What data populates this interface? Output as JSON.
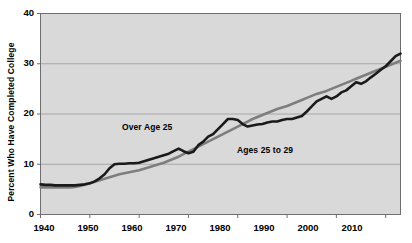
{
  "chart_data": {
    "type": "line",
    "title": "",
    "xlabel": "",
    "ylabel": "Percent  Who Have Completed College",
    "xlim": [
      1940,
      2013
    ],
    "ylim": [
      0,
      40
    ],
    "xticks": [
      1940,
      1950,
      1960,
      1970,
      1980,
      1990,
      2000,
      2010
    ],
    "yticks": [
      0,
      10,
      20,
      30,
      40
    ],
    "grid": "horizontal",
    "legend_position": "inline-annotations",
    "plot_background": "#d9d9d9",
    "figure_background": "#ffffff",
    "gridline_color": "#9a9a9a",
    "series": [
      {
        "name": "Over Age 25",
        "color": "#1a1a1a",
        "label_x": 1958,
        "label_y": 18.0,
        "x": [
          1940,
          1941,
          1942,
          1943,
          1944,
          1945,
          1946,
          1947,
          1948,
          1949,
          1950,
          1951,
          1952,
          1953,
          1954,
          1955,
          1956,
          1957,
          1958,
          1959,
          1960,
          1961,
          1962,
          1963,
          1964,
          1965,
          1966,
          1967,
          1968,
          1969,
          1970,
          1971,
          1972,
          1973,
          1974,
          1975,
          1976,
          1977,
          1978,
          1979,
          1980,
          1981,
          1982,
          1983,
          1984,
          1985,
          1986,
          1987,
          1988,
          1989,
          1990,
          1991,
          1992,
          1993,
          1994,
          1995,
          1996,
          1997,
          1998,
          1999,
          2000,
          2001,
          2002,
          2003,
          2004,
          2005,
          2006,
          2007,
          2008,
          2009,
          2010,
          2011,
          2012,
          2013
        ],
        "values": [
          6.0,
          5.9,
          5.9,
          5.8,
          5.8,
          5.8,
          5.8,
          5.8,
          5.9,
          6.0,
          6.2,
          6.6,
          7.2,
          8.0,
          9.2,
          10.0,
          10.1,
          10.1,
          10.2,
          10.2,
          10.3,
          10.6,
          10.9,
          11.2,
          11.5,
          11.8,
          12.1,
          12.6,
          13.1,
          12.6,
          12.2,
          12.5,
          13.8,
          14.5,
          15.5,
          16.0,
          17.0,
          18.0,
          19.0,
          19.0,
          18.8,
          18.0,
          17.5,
          17.7,
          17.9,
          18.0,
          18.3,
          18.5,
          18.5,
          18.8,
          19.0,
          19.0,
          19.3,
          19.6,
          20.5,
          21.5,
          22.5,
          23.0,
          23.5,
          23.0,
          23.5,
          24.3,
          24.7,
          25.5,
          26.3,
          26.0,
          26.5,
          27.3,
          28.0,
          28.8,
          29.5,
          30.5,
          31.5,
          32.0
        ]
      },
      {
        "name": "Ages 25 to 29",
        "color": "#7e7e7e",
        "label_x": 1985,
        "label_y": 13.6,
        "x": [
          1940,
          1941,
          1942,
          1943,
          1944,
          1945,
          1946,
          1947,
          1948,
          1949,
          1950,
          1951,
          1952,
          1953,
          1954,
          1955,
          1956,
          1957,
          1958,
          1959,
          1960,
          1961,
          1962,
          1963,
          1964,
          1965,
          1966,
          1967,
          1968,
          1969,
          1970,
          1971,
          1972,
          1973,
          1974,
          1975,
          1976,
          1977,
          1978,
          1979,
          1980,
          1981,
          1982,
          1983,
          1984,
          1985,
          1986,
          1987,
          1988,
          1989,
          1990,
          1991,
          1992,
          1993,
          1994,
          1995,
          1996,
          1997,
          1998,
          1999,
          2000,
          2001,
          2002,
          2003,
          2004,
          2005,
          2006,
          2007,
          2008,
          2009,
          2010,
          2011,
          2012,
          2013
        ],
        "values": [
          5.4,
          5.4,
          5.4,
          5.4,
          5.4,
          5.4,
          5.4,
          5.5,
          5.7,
          5.9,
          6.2,
          6.5,
          6.8,
          7.1,
          7.4,
          7.7,
          8.0,
          8.2,
          8.4,
          8.6,
          8.8,
          9.1,
          9.4,
          9.7,
          10.0,
          10.3,
          10.7,
          11.1,
          11.5,
          12.0,
          12.5,
          13.0,
          13.5,
          14.0,
          14.5,
          15.0,
          15.5,
          16.0,
          16.5,
          17.0,
          17.5,
          18.0,
          18.5,
          19.0,
          19.4,
          19.8,
          20.2,
          20.6,
          21.0,
          21.3,
          21.6,
          22.0,
          22.4,
          22.8,
          23.2,
          23.6,
          24.0,
          24.3,
          24.6,
          25.0,
          25.4,
          25.8,
          26.2,
          26.6,
          27.0,
          27.4,
          27.8,
          28.2,
          28.6,
          29.0,
          29.4,
          29.8,
          30.2,
          30.6
        ]
      }
    ]
  },
  "axis": {
    "y_title": "Percent  Who Have Completed College",
    "y_tick_labels": [
      "40",
      "30",
      "20",
      "10",
      "0"
    ],
    "x_tick_labels": [
      "1940",
      "1950",
      "1960",
      "1970",
      "1980",
      "1990",
      "2000",
      "2010"
    ]
  },
  "annotations": {
    "series1_label": "Over Age 25",
    "series2_label": "Ages 25 to 29"
  }
}
